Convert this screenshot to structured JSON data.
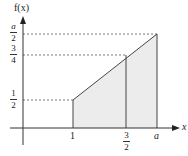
{
  "diagram": {
    "y_axis_label": "f(x)",
    "x_axis_label": "x",
    "y_ticks": [
      {
        "num": "a",
        "den": "2"
      },
      {
        "num": "3",
        "den": "4"
      },
      {
        "num": "1",
        "den": "2"
      }
    ],
    "x_ticks": [
      {
        "label": "1"
      },
      {
        "num": "3",
        "den": "2"
      },
      {
        "label": "a"
      }
    ],
    "shaded_region": "area under f(x) from x=1 to x=a",
    "line": {
      "from": [
        1,
        0.5
      ],
      "to": [
        "a",
        "a/2"
      ]
    },
    "colors": {
      "shade": "#ececec",
      "axis": "#333333",
      "dash": "#555555"
    }
  }
}
